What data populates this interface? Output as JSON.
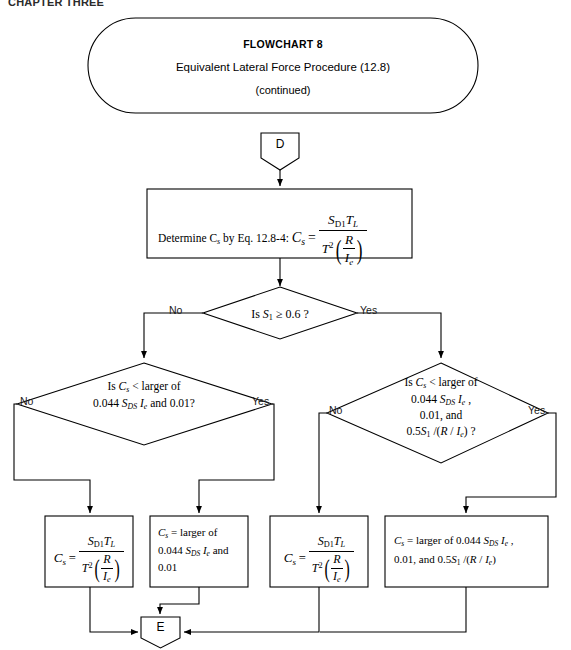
{
  "page": {
    "header": "CHAPTER THREE",
    "width": 571,
    "height": 650,
    "ink_color": "#000000",
    "background": "#ffffff"
  },
  "title_oval": {
    "line1": "FLOWCHART 8",
    "line2": "Equivalent Lateral Force Procedure (12.8)",
    "line3": "(continued)"
  },
  "connectors": {
    "entry": "D",
    "exit": "E"
  },
  "process_top": {
    "lead_text": "Determine C",
    "lead_sub": "s",
    "mid_text": " by Eq. 12.8-4: ",
    "cs_label": "C",
    "cs_sub": "s",
    "equals": "=",
    "numerator_sd1": "S",
    "numerator_sd1_sub": "D1",
    "numerator_tl": "T",
    "numerator_tl_sub": "L",
    "den_t": "T",
    "den_t_exp": "2",
    "den_r": "R",
    "den_ie": "I",
    "den_ie_sub": "e",
    "full_text": "Determine Cs by Eq. 12.8-4: Cs = SD1 TL / ( T^2 ( R / Ie ) )"
  },
  "decision_1": {
    "text_lead": "Is ",
    "symbol_s": "S",
    "symbol_sub": "1",
    "comparison": " ≥ 0.6 ?",
    "full_text": "Is S1 ≥ 0.6 ?",
    "label_no": "No",
    "label_yes": "Yes"
  },
  "decision_left": {
    "line1_a": "Is ",
    "line1_c": "C",
    "line1_c_sub": "s",
    "line1_b": " <  larger of",
    "line2_a": "0.044 ",
    "line2_sds": "S",
    "line2_sds_sub": "DS",
    "line2_ie": " I",
    "line2_ie_sub": "e",
    "line2_b": " and 0.01?",
    "full_text": "Is Cs < larger of 0.044 SDS Ie and 0.01?",
    "label_no": "No",
    "label_yes": "Yes"
  },
  "decision_right": {
    "line1_a": "Is ",
    "line1_c": "C",
    "line1_c_sub": "s",
    "line1_b": " <  larger of",
    "line2_a": "0.044 ",
    "line2_sds": "S",
    "line2_sds_sub": "DS",
    "line2_ie": " I",
    "line2_ie_sub": "e",
    "line2_tail": " ,",
    "line3": "0.01, and",
    "line4_a": "0.5",
    "line4_s": "S",
    "line4_s_sub": "1",
    "line4_b": " /(",
    "line4_r": "R",
    "line4_slash": " / ",
    "line4_ie": "I",
    "line4_ie_sub": "e",
    "line4_end": ") ?",
    "full_text": "Is Cs < larger of 0.044 SDS Ie , 0.01, and 0.5S1 /(R / Ie) ?",
    "label_no": "No",
    "label_yes": "Yes"
  },
  "result_box_1": {
    "cs": "C",
    "cs_sub": "s",
    "equals": "=",
    "num_sd1": "S",
    "num_sd1_sub": "D1",
    "num_tl": "T",
    "num_tl_sub": "L",
    "den_t": "T",
    "den_t_exp": "2",
    "den_r": "R",
    "den_ie": "I",
    "den_ie_sub": "e",
    "full_text": "Cs = SD1 TL / ( T^2 ( R / Ie ) )"
  },
  "result_box_2": {
    "line1_cs": "C",
    "line1_cs_sub": "s",
    "line1_rest": "  =   larger of",
    "line2_a": "0.044 ",
    "line2_sds": "S",
    "line2_sds_sub": "DS",
    "line2_ie": " I",
    "line2_ie_sub": "e",
    "line2_b": " and",
    "line3": "0.01",
    "full_text": "Cs = larger of 0.044 SDS Ie and 0.01"
  },
  "result_box_3": {
    "cs": "C",
    "cs_sub": "s",
    "equals": "=",
    "num_sd1": "S",
    "num_sd1_sub": "D1",
    "num_tl": "T",
    "num_tl_sub": "L",
    "den_t": "T",
    "den_t_exp": "2",
    "den_r": "R",
    "den_ie": "I",
    "den_ie_sub": "e",
    "full_text": "Cs = SD1 TL / ( T^2 ( R / Ie ) )"
  },
  "result_box_4": {
    "line1_cs": "C",
    "line1_cs_sub": "s",
    "line1_mid": "  =   larger of 0.044 ",
    "line1_sds": "S",
    "line1_sds_sub": "DS",
    "line1_ie": " I",
    "line1_ie_sub": "e",
    "line1_tail": " ,",
    "line2_a": "0.01, and  0.5",
    "line2_s": "S",
    "line2_s_sub": "1",
    "line2_b": " /(",
    "line2_r": "R",
    "line2_slash": " / ",
    "line2_ie": "I",
    "line2_ie_sub": "e",
    "line2_end": ")",
    "full_text": "Cs = larger of 0.044 SDS Ie , 0.01, and 0.5S1 /(R / Ie)"
  }
}
